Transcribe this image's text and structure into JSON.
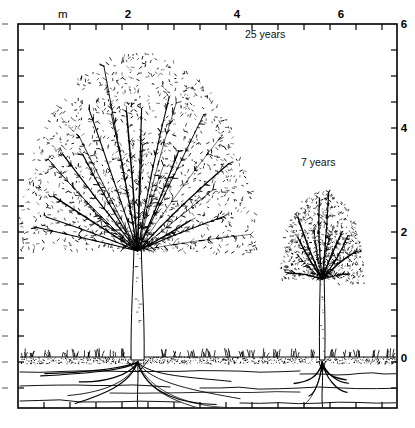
{
  "figure": {
    "title": "",
    "unit_label": "m",
    "background_color": "#ffffff",
    "ink_color": "#000000"
  },
  "axes": {
    "frame": {
      "x0": 18,
      "y0": 24,
      "x1": 397,
      "y1": 408
    },
    "x_axis": {
      "label": "",
      "unit": "m",
      "min": 0,
      "max": 7.3,
      "tick_interval": 0.5,
      "label_interval": 2,
      "tick_labels": [
        "2",
        "4",
        "6"
      ],
      "tick_label_values": [
        2,
        4,
        6
      ],
      "tick_label_positions_px": [
        128,
        237,
        341
      ],
      "tick_positions_px": [
        18,
        44,
        70,
        96,
        122,
        148,
        174,
        200,
        226,
        252,
        278,
        304,
        330,
        356,
        382
      ],
      "ticks_top": true,
      "ticks_bottom": true
    },
    "y_axis": {
      "label": "",
      "unit": "m",
      "min": -1.0,
      "max": 6.4,
      "tick_interval": 0.5,
      "label_interval": 2,
      "tick_labels": [
        "6",
        "4",
        "2",
        "0"
      ],
      "tick_label_values": [
        6,
        4,
        2,
        0
      ],
      "tick_label_positions_px": [
        24,
        128,
        232,
        358
      ],
      "ticks_left": true,
      "ticks_right": true,
      "ground_level_px": 358,
      "meter_px": 52
    }
  },
  "annotations": [
    {
      "name": "large-tree-age-label",
      "text": "25 years",
      "x_px": 245,
      "y_px": 38
    },
    {
      "name": "small-tree-age-label",
      "text": "7 years",
      "x_px": 301,
      "y_px": 166
    }
  ],
  "chart_data": {
    "type": "diagram",
    "title": "",
    "xlabel": "m",
    "ylabel": "m",
    "xlim": [
      0,
      7.3
    ],
    "ylim": [
      -1.0,
      6.4
    ],
    "grid": false,
    "legend": "none",
    "subjects": [
      {
        "name": "large-tree",
        "label": "25 years",
        "age_years": 25,
        "trunk_center_m": 2.3,
        "height_m": 5.9,
        "crown_width_m": 4.6,
        "crown_top_m": 5.9,
        "crown_base_m": 2.1,
        "trunk_base_m": 0.0,
        "root_depth_m": -0.95,
        "root_spread_m": 4.4
      },
      {
        "name": "small-tree",
        "label": "7 years",
        "age_years": 7,
        "trunk_center_m": 5.85,
        "height_m": 3.3,
        "crown_width_m": 1.6,
        "crown_top_m": 3.25,
        "crown_base_m": 1.55,
        "trunk_base_m": 0.0,
        "root_depth_m": -0.9,
        "root_spread_m": 1.4
      }
    ],
    "ground": {
      "name": "ground-line",
      "level_m": 0,
      "level_px": 358,
      "soil_band_px": [
        356,
        364
      ],
      "soil_layer_lines_px": [
        372,
        386,
        400
      ]
    }
  }
}
